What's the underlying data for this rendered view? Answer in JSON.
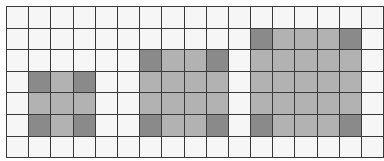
{
  "grid": {
    "rows": 7,
    "cols": 17,
    "colors": {
      "empty": "#f6f6f6",
      "light": "#b2b2b2",
      "dark": "#8a8a8a",
      "line": "#3a3a3a"
    },
    "shapes": [
      {
        "name": "square-3x3",
        "row": 3,
        "col": 1,
        "height": 3,
        "width": 3
      },
      {
        "name": "square-4x4",
        "row": 2,
        "col": 6,
        "height": 4,
        "width": 4
      },
      {
        "name": "square-5x5",
        "row": 1,
        "col": 11,
        "height": 5,
        "width": 5
      }
    ]
  }
}
